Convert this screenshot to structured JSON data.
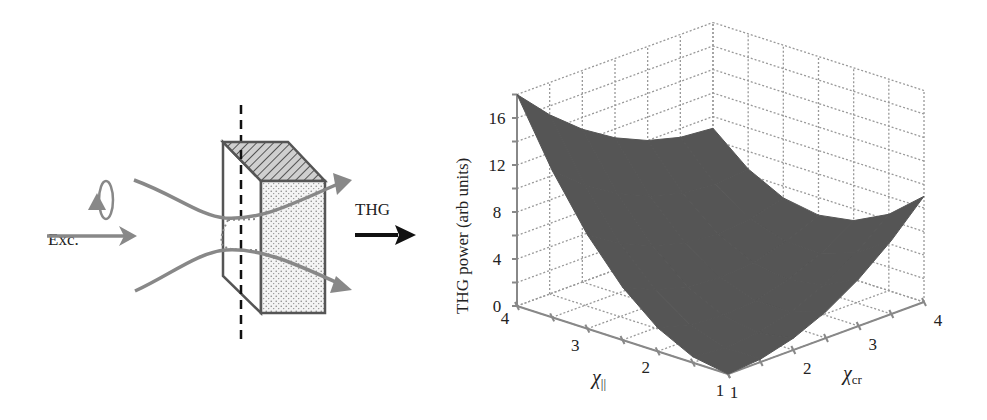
{
  "diagram": {
    "excitation_label": "Exc.",
    "output_label": "THG",
    "beam_color": "#888888",
    "box_edge_color": "#555555",
    "arrow_color": "#111111"
  },
  "chart_data": {
    "type": "surface3d",
    "title": "",
    "zlabel": "THG power (arb units)",
    "xlabel": "χ||",
    "xlabel_main": "χ",
    "xlabel_sub": "||",
    "ylabel": "χcr",
    "ylabel_main": "χ",
    "ylabel_sub": "cr",
    "x_ticks": [
      1,
      2,
      3,
      4
    ],
    "y_ticks": [
      1,
      2,
      3,
      4
    ],
    "z_ticks": [
      0,
      4,
      8,
      12,
      16
    ],
    "xlim": [
      1,
      4
    ],
    "ylim": [
      1,
      4
    ],
    "zlim": [
      0,
      18
    ],
    "grid": true,
    "surface_color": "#555555",
    "formula_note": "approx z = 2(x-1)^2 + (y-1)^2 - 2(x-1)(y-1)",
    "corner_values": [
      {
        "x": 1,
        "y": 1,
        "z": 0
      },
      {
        "x": 4,
        "y": 1,
        "z": 18
      },
      {
        "x": 1,
        "y": 4,
        "z": 9
      },
      {
        "x": 4,
        "y": 4,
        "z": 9
      }
    ],
    "grid_x": [
      1,
      1.5,
      2,
      2.5,
      3,
      3.5,
      4
    ],
    "grid_y": [
      1,
      1.5,
      2,
      2.5,
      3,
      3.5,
      4
    ],
    "z_values": [
      [
        0,
        0.25,
        1,
        2.25,
        4,
        6.25,
        9
      ],
      [
        0.5,
        0.25,
        0.5,
        1.25,
        2.5,
        4.25,
        6.5
      ],
      [
        2,
        1.25,
        1,
        1.25,
        2,
        3.25,
        5
      ],
      [
        4.5,
        3.25,
        2.5,
        2.25,
        2.5,
        3.25,
        4.5
      ],
      [
        8,
        6.25,
        5,
        4.25,
        4,
        4.25,
        5
      ],
      [
        12.5,
        10.25,
        8.5,
        7.25,
        6.5,
        6.25,
        6.5
      ],
      [
        18,
        15.25,
        13,
        11.25,
        10,
        9.25,
        9
      ]
    ]
  }
}
